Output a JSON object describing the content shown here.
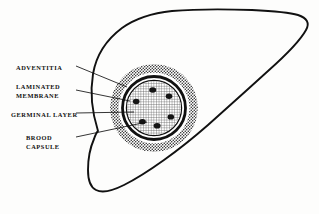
{
  "figure": {
    "organ": "liver-outline",
    "background_color": "#fdfdfc",
    "ink_color": "#111111"
  },
  "labels": [
    {
      "id": "adventitia",
      "lines": [
        "ADVENTITIA"
      ],
      "target_layer": "adventitia-ring"
    },
    {
      "id": "laminated-membrane",
      "lines": [
        "LAMINATED",
        "MEMBRANE"
      ],
      "target_layer": "laminated-membrane-ring"
    },
    {
      "id": "germinal-layer",
      "lines": [
        "GERMINAL LAYER"
      ],
      "target_layer": "germinal-layer-ring"
    },
    {
      "id": "brood-capsule",
      "lines": [
        "BROOD",
        "CAPSULE"
      ],
      "target_layer": "brood-capsule-dot"
    }
  ],
  "cyst": {
    "center_x": 154,
    "center_y": 108,
    "layers": [
      {
        "name": "adventitia",
        "radius": 44,
        "fill": "stipple",
        "stroke": "none"
      },
      {
        "name": "clear-zone",
        "radius": 36,
        "fill": "#ffffff",
        "stroke": "none"
      },
      {
        "name": "laminated-membrane",
        "radius": 32,
        "fill": "none",
        "stroke": "#111111",
        "stroke_width": 2.6
      },
      {
        "name": "germinal-layer",
        "radius": 28,
        "fill": "none",
        "stroke": "#111111",
        "stroke_width": 1.3
      },
      {
        "name": "hydatid-fluid",
        "radius": 27,
        "fill": "crosshatch",
        "stroke": "none"
      }
    ],
    "brood_capsule_count": 6,
    "brood_capsules": [
      {
        "angle_deg": 266,
        "radius": 18,
        "rx": 3.4,
        "ry": 2.7
      },
      {
        "angle_deg": 322,
        "radius": 19,
        "rx": 3.2,
        "ry": 2.6
      },
      {
        "angle_deg": 28,
        "radius": 19,
        "rx": 3.2,
        "ry": 2.6
      },
      {
        "angle_deg": 80,
        "radius": 18,
        "rx": 3.4,
        "ry": 2.7
      },
      {
        "angle_deg": 130,
        "radius": 18,
        "rx": 3.3,
        "ry": 2.6
      },
      {
        "angle_deg": 200,
        "radius": 19,
        "rx": 3.2,
        "ry": 2.6
      }
    ]
  },
  "leader_lines": [
    {
      "id": "leader-adventitia",
      "x1": 75,
      "y1": 66,
      "x2": 126,
      "y2": 88
    },
    {
      "id": "leader-laminated-membrane",
      "x1": 75,
      "y1": 90,
      "x2": 129,
      "y2": 100
    },
    {
      "id": "leader-germinal-layer",
      "x1": 75,
      "y1": 113,
      "x2": 133,
      "y2": 112
    },
    {
      "id": "leader-brood-capsule",
      "x1": 75,
      "y1": 137,
      "x2": 146,
      "y2": 122
    }
  ]
}
